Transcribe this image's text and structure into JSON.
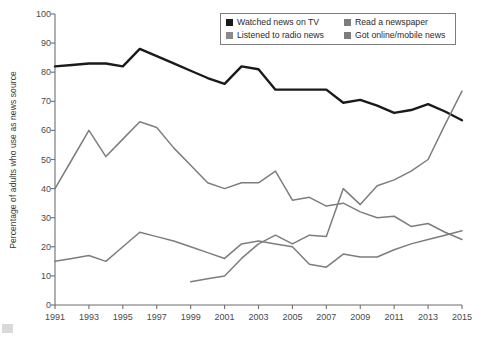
{
  "chart_data": {
    "type": "line",
    "title": "",
    "xlabel": "",
    "ylabel": "Percentage of adults who use as news source",
    "xlim": [
      1991,
      2015
    ],
    "ylim": [
      0,
      100
    ],
    "ytick_step": 10,
    "yticks": [
      0,
      10,
      20,
      30,
      40,
      50,
      60,
      70,
      80,
      90,
      100
    ],
    "xticks": [
      1991,
      1993,
      1995,
      1997,
      1999,
      2001,
      2003,
      2005,
      2007,
      2009,
      2011,
      2013,
      2015
    ],
    "xtick_labels": [
      "1991",
      "1993",
      "1995",
      "1997",
      "1999",
      "2001",
      "2003",
      "2005",
      "2007",
      "2009",
      "2011",
      "2013",
      "2015"
    ],
    "grid": false,
    "legend_position": "top-center-right",
    "x": [
      1991,
      1992,
      1993,
      1994,
      1995,
      1996,
      1997,
      1998,
      1999,
      2000,
      2001,
      2002,
      2003,
      2004,
      2005,
      2006,
      2007,
      2008,
      2009,
      2010,
      2011,
      2012,
      2013,
      2014,
      2015
    ],
    "series": [
      {
        "name": "Watched news on TV",
        "color": "#1a1a1a",
        "width": 2.4,
        "x": [
          1991,
          1992,
          1993,
          1994,
          1995,
          1996,
          1997,
          1998,
          1999,
          2000,
          2001,
          2002,
          2003,
          2004,
          2005,
          2006,
          2007,
          2008,
          2009,
          2010,
          2011,
          2012,
          2013,
          2014,
          2015
        ],
        "values": [
          82,
          82.5,
          83,
          83,
          82,
          88,
          85.5,
          83,
          80.5,
          78,
          76,
          82,
          81,
          74,
          74,
          74,
          74,
          69.5,
          70.5,
          68.5,
          66,
          67,
          69,
          66.5,
          63.5
        ]
      },
      {
        "name": "Read a newspaper",
        "color": "#7d7d7d",
        "width": 1.5,
        "x": [
          1991,
          1992,
          1993,
          1994,
          1995,
          1996,
          1997,
          1998,
          1999,
          2000,
          2001,
          2002,
          2003,
          2004,
          2005,
          2006,
          2007,
          2008,
          2009,
          2010,
          2011,
          2012,
          2013,
          2014,
          2015
        ],
        "values": [
          40,
          50,
          60,
          51,
          57,
          63,
          61,
          54,
          48,
          42,
          40,
          42,
          42,
          46,
          36,
          37,
          34,
          35,
          32,
          30,
          30.5,
          27,
          28,
          25,
          22.5
        ]
      },
      {
        "name": "Listened to radio news",
        "color": "#7d7d7d",
        "width": 1.5,
        "x": [
          1991,
          1992,
          1993,
          1994,
          1995,
          1996,
          1997,
          1998,
          1999,
          2000,
          2001,
          2002,
          2003,
          2004,
          2005,
          2006,
          2007,
          2008,
          2009,
          2010,
          2011,
          2012,
          2013,
          2014,
          2015
        ],
        "values": [
          15,
          16,
          17,
          15,
          20,
          25,
          23.5,
          22,
          20,
          18,
          16,
          21,
          22,
          21,
          20,
          14,
          13,
          17.5,
          16.5,
          16.5,
          19,
          21,
          22.5,
          24,
          25.5
        ]
      },
      {
        "name": "Got online/mobile news",
        "color": "#7d7d7d",
        "width": 1.5,
        "x": [
          1999,
          2000,
          2001,
          2002,
          2003,
          2004,
          2005,
          2006,
          2007,
          2008,
          2009,
          2010,
          2011,
          2012,
          2013,
          2014,
          2015
        ],
        "values": [
          8,
          9,
          10,
          16,
          21,
          24,
          21,
          24,
          23.5,
          40,
          34.5,
          41,
          43,
          46,
          50,
          62,
          73.5
        ]
      }
    ]
  },
  "legend": {
    "items": [
      {
        "label": "Watched news on TV",
        "color": "#1a1a1a"
      },
      {
        "label": "Read a newspaper",
        "color": "#7d7d7d"
      },
      {
        "label": "Listened to radio news",
        "color": "#8a8a8a"
      },
      {
        "label": "Got online/mobile news",
        "color": "#7d7d7d"
      }
    ]
  },
  "axes": {
    "y_title": "Percentage of adults who use as news source"
  }
}
